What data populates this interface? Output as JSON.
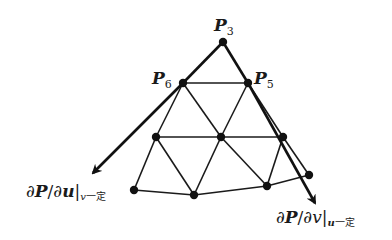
{
  "diagram": {
    "type": "triangular-mesh-with-tangent-vectors",
    "colors": {
      "line": "#1a1a1a",
      "node": "#111111",
      "background": "#ffffff"
    },
    "labels": {
      "p3": {
        "main": "P",
        "sub": "3"
      },
      "p6": {
        "main": "P",
        "sub": "6"
      },
      "p5": {
        "main": "P",
        "sub": "5"
      },
      "du": {
        "prefix": "∂",
        "p": "P",
        "slash": "/∂",
        "var": "u",
        "bar": "|",
        "cond_var": "v",
        "cond": "一定"
      },
      "dv": {
        "prefix": "∂",
        "p": "P",
        "slash": "/∂",
        "var": "v",
        "bar": "|",
        "cond_var": "u",
        "cond": "一定"
      }
    },
    "nodes": [
      {
        "id": "P3",
        "x": 223,
        "y": 42
      },
      {
        "id": "P6",
        "x": 183,
        "y": 83
      },
      {
        "id": "P5",
        "x": 248,
        "y": 83
      },
      {
        "id": "m1",
        "x": 156,
        "y": 137
      },
      {
        "id": "m2",
        "x": 221,
        "y": 137
      },
      {
        "id": "m3",
        "x": 283,
        "y": 137
      },
      {
        "id": "b1",
        "x": 134,
        "y": 190
      },
      {
        "id": "b2",
        "x": 194,
        "y": 195
      },
      {
        "id": "b3",
        "x": 267,
        "y": 186
      },
      {
        "id": "b4",
        "x": 309,
        "y": 175
      }
    ],
    "arrows": [
      {
        "name": "du-arrow",
        "from": [
          223,
          42
        ],
        "to": [
          93,
          173
        ]
      },
      {
        "name": "dv-arrow",
        "from": [
          223,
          42
        ],
        "to": [
          315,
          203
        ]
      }
    ]
  }
}
